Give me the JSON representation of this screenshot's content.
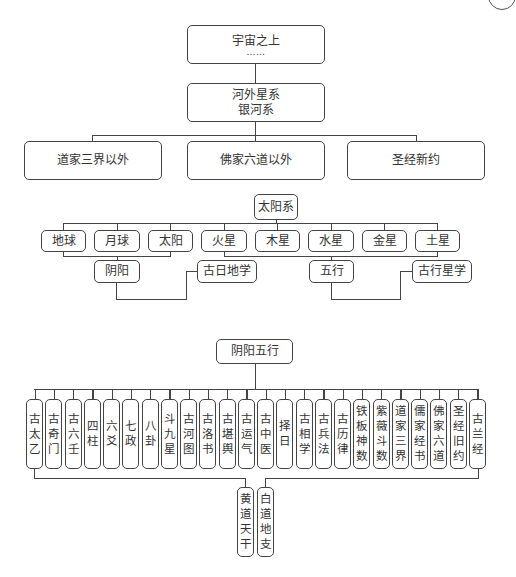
{
  "top": {
    "universe": {
      "label": "宇宙之上",
      "ellipsis": "……"
    },
    "galaxy": {
      "line1": "河外星系",
      "line2": "银河系"
    }
  },
  "realms": [
    {
      "label": "道家三界以外"
    },
    {
      "label": "佛家六道以外"
    },
    {
      "label": "圣经新约"
    }
  ],
  "solar": {
    "title": "太阳系",
    "bodies": [
      {
        "label": "地球"
      },
      {
        "label": "月球"
      },
      {
        "label": "太阳"
      },
      {
        "label": "火星"
      },
      {
        "label": "木星"
      },
      {
        "label": "水星"
      },
      {
        "label": "金星"
      },
      {
        "label": "土星"
      }
    ],
    "derived": [
      {
        "label": "阴阳"
      },
      {
        "label": "古日地学"
      },
      {
        "label": "五行"
      },
      {
        "label": "古行星学"
      }
    ]
  },
  "yinyang": {
    "title": "阴阳五行",
    "branches": [
      {
        "chars": [
          "古",
          "太",
          "乙"
        ]
      },
      {
        "chars": [
          "古",
          "奇",
          "门"
        ]
      },
      {
        "chars": [
          "古",
          "六",
          "壬"
        ]
      },
      {
        "chars": [
          "四",
          "柱"
        ]
      },
      {
        "chars": [
          "六",
          "爻"
        ]
      },
      {
        "chars": [
          "七",
          "政"
        ]
      },
      {
        "chars": [
          "八",
          "卦"
        ]
      },
      {
        "chars": [
          "斗",
          "九",
          "星"
        ]
      },
      {
        "chars": [
          "古",
          "河",
          "图"
        ]
      },
      {
        "chars": [
          "古",
          "洛",
          "书"
        ]
      },
      {
        "chars": [
          "古",
          "堪",
          "舆"
        ]
      },
      {
        "chars": [
          "古",
          "运",
          "气"
        ]
      },
      {
        "chars": [
          "古",
          "中",
          "医"
        ]
      },
      {
        "chars": [
          "择",
          "日"
        ]
      },
      {
        "chars": [
          "古",
          "相",
          "学"
        ]
      },
      {
        "chars": [
          "古",
          "兵",
          "法"
        ]
      },
      {
        "chars": [
          "古",
          "历",
          "律"
        ]
      },
      {
        "chars": [
          "铁",
          "板",
          "神",
          "数"
        ]
      },
      {
        "chars": [
          "紫",
          "薇",
          "斗",
          "数"
        ]
      },
      {
        "chars": [
          "道",
          "家",
          "三",
          "界"
        ]
      },
      {
        "chars": [
          "儒",
          "家",
          "经",
          "书"
        ]
      },
      {
        "chars": [
          "佛",
          "家",
          "六",
          "道"
        ]
      },
      {
        "chars": [
          "圣",
          "经",
          "旧",
          "约"
        ]
      },
      {
        "chars": [
          "古",
          "兰",
          "经"
        ]
      }
    ],
    "roots": [
      {
        "chars": [
          "黄",
          "道",
          "天",
          "干"
        ]
      },
      {
        "chars": [
          "白",
          "道",
          "地",
          "支"
        ]
      }
    ]
  }
}
